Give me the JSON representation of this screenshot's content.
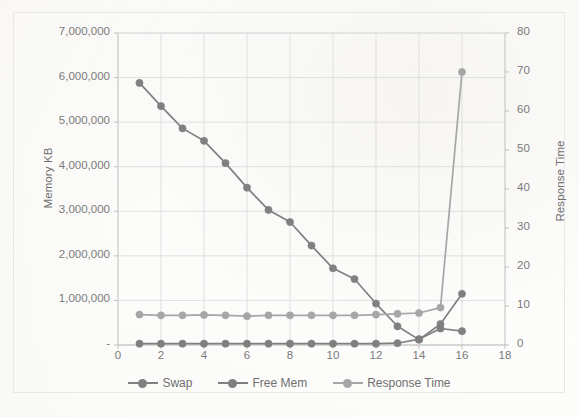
{
  "chart_data": {
    "type": "line",
    "title": "",
    "subtitle": "",
    "xlabel": "",
    "ylabel": "Memory KB",
    "y2label": "Response Time",
    "x": [
      1,
      2,
      3,
      4,
      5,
      6,
      7,
      8,
      9,
      10,
      11,
      12,
      13,
      14,
      15,
      16
    ],
    "xlim": [
      0,
      18
    ],
    "ylim": [
      0,
      7000000
    ],
    "y2lim": [
      0,
      80
    ],
    "xticks": [
      0,
      2,
      4,
      6,
      8,
      10,
      12,
      14,
      16,
      18
    ],
    "xtick_labels": [
      "0",
      "2",
      "4",
      "6",
      "8",
      "10",
      "12",
      "14",
      "16",
      "18"
    ],
    "yticks": [
      0,
      1000000,
      2000000,
      3000000,
      4000000,
      5000000,
      6000000,
      7000000
    ],
    "ytick_labels": [
      "-",
      "1,000,000",
      "2,000,000",
      "3,000,000",
      "4,000,000",
      "5,000,000",
      "6,000,000",
      "7,000,000"
    ],
    "y2ticks": [
      0,
      10,
      20,
      30,
      40,
      50,
      60,
      70,
      80
    ],
    "y2tick_labels": [
      "0",
      "10",
      "20",
      "30",
      "40",
      "50",
      "60",
      "70",
      "80"
    ],
    "grid": true,
    "legend_position": "bottom",
    "series": [
      {
        "name": "Swap",
        "axis": "left",
        "color": "#808080",
        "marker": "circle",
        "values": [
          5880000,
          5360000,
          4860000,
          4580000,
          4080000,
          3530000,
          3030000,
          2760000,
          2230000,
          1720000,
          1480000,
          930000,
          420000,
          120000,
          470000,
          1150000
        ]
      },
      {
        "name": "Free Mem",
        "axis": "left",
        "color": "#7f7f7f",
        "marker": "circle",
        "values": [
          30000,
          30000,
          30000,
          30000,
          30000,
          30000,
          30000,
          30000,
          30000,
          30000,
          30000,
          30000,
          40000,
          130000,
          370000,
          310000
        ]
      },
      {
        "name": "Response Time",
        "axis": "right",
        "color": "#a6a6a6",
        "marker": "circle",
        "values": [
          7.8,
          7.6,
          7.6,
          7.7,
          7.6,
          7.4,
          7.6,
          7.6,
          7.6,
          7.6,
          7.6,
          7.8,
          8.0,
          8.2,
          9.6,
          70.0
        ]
      }
    ]
  },
  "colors": {
    "swap": "#808080",
    "free_mem": "#7f7f7f",
    "response_time": "#a6a6a6",
    "grid": "#d9d9d9",
    "axis": "#bfbfbf",
    "text": "#7a7a7a",
    "frame": "#e9e8e6",
    "background": "#fdfdfc"
  },
  "legend": {
    "items": [
      {
        "label": "Swap"
      },
      {
        "label": "Free Mem"
      },
      {
        "label": "Response Time"
      }
    ]
  }
}
